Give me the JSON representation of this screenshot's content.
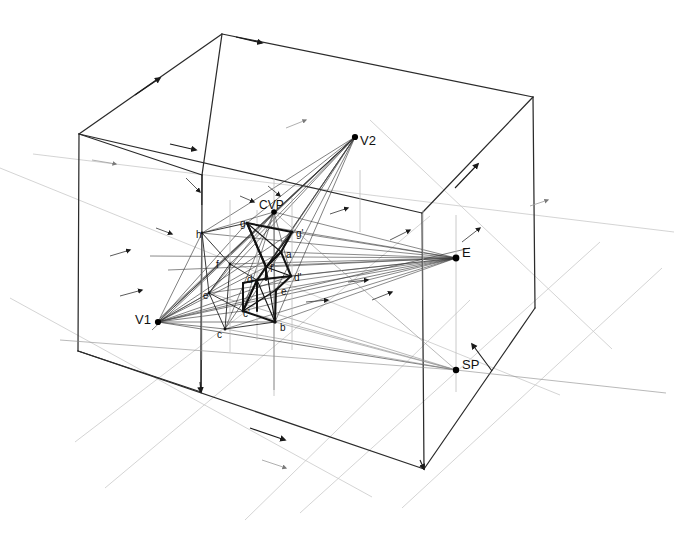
{
  "figure": {
    "background": "#ffffff",
    "width": 674,
    "height": 537
  },
  "palette": {
    "heavy_ink": "#111111",
    "box_ink": "#2b2b2b",
    "construction": "#3a3a3a",
    "faint": "#b9b9b9",
    "very_faint": "#d8d8d8",
    "point": "#000000"
  },
  "labels": [
    {
      "id": "V2",
      "text": "V2",
      "x": 360,
      "y": 145,
      "size": 13,
      "anchor": "start"
    },
    {
      "id": "V1",
      "text": "V1",
      "x": 135,
      "y": 324,
      "size": 13,
      "anchor": "start"
    },
    {
      "id": "E",
      "text": "E",
      "x": 462,
      "y": 257,
      "size": 13,
      "anchor": "start"
    },
    {
      "id": "SP",
      "text": "SP",
      "x": 462,
      "y": 369,
      "size": 13,
      "anchor": "start"
    },
    {
      "id": "CVP",
      "text": "CVP",
      "x": 259,
      "y": 209,
      "size": 12,
      "anchor": "start"
    },
    {
      "id": "h",
      "text": "h",
      "x": 196,
      "y": 238,
      "size": 10,
      "anchor": "start"
    },
    {
      "id": "g",
      "text": "g",
      "x": 240,
      "y": 227,
      "size": 10,
      "anchor": "start"
    },
    {
      "id": "g2",
      "text": "g'",
      "x": 296,
      "y": 237,
      "size": 10,
      "anchor": "start"
    },
    {
      "id": "a",
      "text": "a",
      "x": 286,
      "y": 258,
      "size": 10,
      "anchor": "start"
    },
    {
      "id": "f",
      "text": "f",
      "x": 216,
      "y": 268,
      "size": 10,
      "anchor": "start"
    },
    {
      "id": "f2",
      "text": "f'",
      "x": 270,
      "y": 272,
      "size": 10,
      "anchor": "start"
    },
    {
      "id": "d",
      "text": "d",
      "x": 247,
      "y": 283,
      "size": 10,
      "anchor": "start"
    },
    {
      "id": "d2",
      "text": "d'",
      "x": 294,
      "y": 281,
      "size": 10,
      "anchor": "start"
    },
    {
      "id": "e",
      "text": "e",
      "x": 281,
      "y": 295,
      "size": 10,
      "anchor": "start"
    },
    {
      "id": "e2",
      "text": "e'",
      "x": 203,
      "y": 299,
      "size": 10,
      "anchor": "start"
    },
    {
      "id": "c",
      "text": "c",
      "x": 217,
      "y": 338,
      "size": 10,
      "anchor": "start"
    },
    {
      "id": "c2",
      "text": "c'",
      "x": 243,
      "y": 317,
      "size": 10,
      "anchor": "start"
    },
    {
      "id": "b",
      "text": "b",
      "x": 280,
      "y": 331,
      "size": 10,
      "anchor": "start"
    }
  ],
  "points": {
    "V1": [
      158,
      322
    ],
    "V2": [
      355,
      137
    ],
    "E": [
      456,
      258
    ],
    "SP": [
      456,
      370
    ],
    "CVP": [
      274,
      212
    ],
    "a": [
      281,
      252
    ],
    "b": [
      275,
      322
    ],
    "c": [
      225,
      329
    ],
    "cp": [
      243,
      311
    ],
    "d": [
      257,
      280
    ],
    "dp": [
      291,
      276
    ],
    "e": [
      276,
      290
    ],
    "ep": [
      209,
      293
    ],
    "f": [
      230,
      264
    ],
    "fp": [
      266,
      267
    ],
    "g": [
      247,
      223
    ],
    "gp": [
      292,
      232
    ],
    "h": [
      202,
      233
    ]
  },
  "box": {
    "top_back": [
      222,
      34
    ],
    "top_left": [
      79,
      134
    ],
    "top_right": [
      533,
      97
    ],
    "top_front": [
      422,
      213
    ],
    "bot_left": [
      78,
      351
    ],
    "bot_front": [
      424,
      469
    ],
    "bot_right": [
      535,
      308
    ],
    "mid_top": [
      202,
      175
    ],
    "mid_bot": [
      201,
      392
    ]
  },
  "notes": {
    "line_style": "pencil technical drawing, hand drafted",
    "arrowheads": "directional arrowheads along box edges and rays"
  }
}
